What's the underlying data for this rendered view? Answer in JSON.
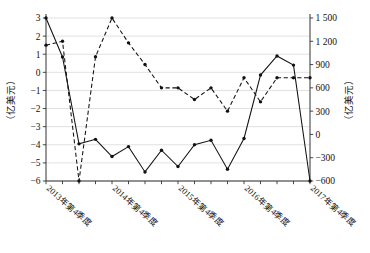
{
  "chart_data": {
    "type": "line",
    "title": "",
    "xlabel": "",
    "ylabel": "（亿美元）",
    "y2label": "（亿美元）",
    "grid": true,
    "legend_position": "none",
    "ylim": [
      -6,
      3
    ],
    "y2lim": [
      -600,
      1500
    ],
    "yticks": [
      "3",
      "2",
      "1",
      "0",
      "−1",
      "−2",
      "−3",
      "−4",
      "−5",
      "−6"
    ],
    "ytick_values": [
      3,
      2,
      1,
      0,
      -1,
      -2,
      -3,
      -4,
      -5,
      -6
    ],
    "y2ticks": [
      "1 500",
      "1 200",
      "900",
      "600",
      "300",
      "0",
      "−300",
      "−600"
    ],
    "y2tick_values": [
      1500,
      1200,
      900,
      600,
      300,
      0,
      -300,
      -600
    ],
    "x": [
      "2013年第4季度",
      "2014年第1季度",
      "2014年第2季度",
      "2014年第3季度",
      "2014年第4季度",
      "2015年第1季度",
      "2015年第2季度",
      "2015年第3季度",
      "2015年第4季度",
      "2016年第1季度",
      "2016年第2季度",
      "2016年第3季度",
      "2016年第4季度",
      "2017年第1季度",
      "2017年第2季度",
      "2017年第3季度",
      "2017年第4季度"
    ],
    "xtick_labels": [
      "2013年第4季度",
      "2014年第4季度",
      "2015年第4季度",
      "2016年第4季度",
      "2017年第4季度"
    ],
    "xtick_indices": [
      0,
      4,
      8,
      12,
      16
    ],
    "series": [
      {
        "name": "solid",
        "axis": "left",
        "style": "solid",
        "values": [
          3.0,
          0.85,
          -3.95,
          -3.7,
          -4.65,
          -4.1,
          -5.5,
          -4.3,
          -5.2,
          -4.0,
          -3.75,
          -5.35,
          -3.65,
          -0.15,
          0.9,
          0.4,
          -6.0
        ]
      },
      {
        "name": "dashed",
        "axis": "right",
        "style": "dashed",
        "values": [
          1150,
          1200,
          -600,
          1000,
          1500,
          1180,
          900,
          600,
          600,
          450,
          600,
          300,
          730,
          420,
          730,
          730,
          730
        ]
      }
    ]
  },
  "axis": {
    "left_title": "（亿美元）",
    "right_title": "（亿美元）"
  }
}
